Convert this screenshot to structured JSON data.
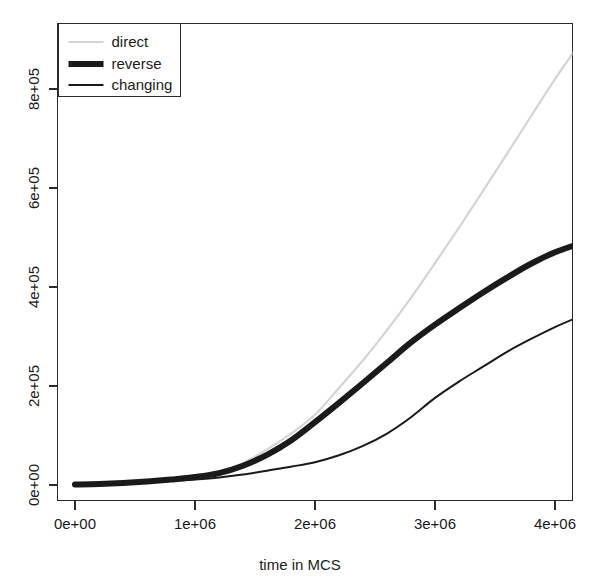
{
  "chart_data": {
    "type": "line",
    "title": "",
    "xlabel": "time in MCS",
    "ylabel": "",
    "xlim": [
      0,
      4200000
    ],
    "ylim": [
      0,
      900000
    ],
    "grid": false,
    "legend_position": "top-left",
    "x_ticks": [
      {
        "value": 0,
        "label": "0e+00"
      },
      {
        "value": 1000000,
        "label": "1e+06"
      },
      {
        "value": 2000000,
        "label": "2e+06"
      },
      {
        "value": 3000000,
        "label": "3e+06"
      },
      {
        "value": 4000000,
        "label": "4e+06"
      }
    ],
    "y_ticks": [
      {
        "value": 0,
        "label": "0e+00"
      },
      {
        "value": 200000,
        "label": "2e+05"
      },
      {
        "value": 400000,
        "label": "4e+05"
      },
      {
        "value": 600000,
        "label": "6e+05"
      },
      {
        "value": 800000,
        "label": "8e+05"
      }
    ],
    "x": [
      0,
      200000,
      400000,
      600000,
      800000,
      1000000,
      1200000,
      1400000,
      1600000,
      1800000,
      2000000,
      2200000,
      2400000,
      2600000,
      2800000,
      3000000,
      3200000,
      3400000,
      3600000,
      3800000,
      4000000,
      4200000
    ],
    "series": [
      {
        "name": "direct",
        "color": "#d4d4d4",
        "width": 2.2,
        "values": [
          1000,
          2000,
          4000,
          7000,
          11000,
          16000,
          25000,
          44000,
          72000,
          104000,
          142000,
          196000,
          252000,
          313000,
          378000,
          448000,
          520000,
          594000,
          669000,
          745000,
          820000,
          890000
        ]
      },
      {
        "name": "reverse",
        "color": "#1a1a1a",
        "width": 6.0,
        "values": [
          1000,
          2000,
          4000,
          7000,
          11000,
          16000,
          24000,
          39000,
          61000,
          90000,
          127000,
          166000,
          206000,
          247000,
          288000,
          324000,
          357000,
          389000,
          419000,
          447000,
          470000,
          487000
        ]
      },
      {
        "name": "changing",
        "color": "#1a1a1a",
        "width": 2.0,
        "values": [
          1000,
          2000,
          3000,
          5000,
          8000,
          11000,
          15000,
          21000,
          29000,
          37000,
          46000,
          60000,
          79000,
          104000,
          137000,
          176000,
          209000,
          239000,
          269000,
          295000,
          319000,
          340000
        ]
      }
    ]
  },
  "legend": {
    "entries": [
      {
        "label": "direct"
      },
      {
        "label": "reverse"
      },
      {
        "label": "changing"
      }
    ]
  },
  "axes": {
    "x_title": "time in MCS"
  }
}
